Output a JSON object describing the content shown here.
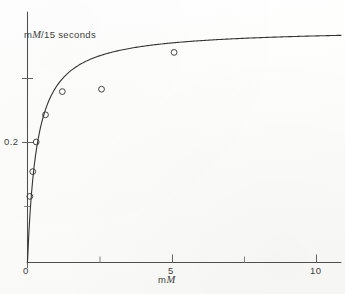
{
  "chart_data": {
    "type": "scatter",
    "title": "",
    "subtitle": "",
    "xlabel": "mM",
    "ylabel": "mM/15 seconds",
    "ylabel_prefix": "m",
    "ylabel_italic": "M",
    "ylabel_suffix": "/15 seconds",
    "xlabel_prefix": "m",
    "xlabel_italic": "M",
    "xlabel_suffix": "",
    "xlim": [
      0,
      10.8
    ],
    "ylim": [
      0,
      0.3125
    ],
    "grid": false,
    "legend": "none",
    "x_ticks_major": [
      0,
      5,
      10
    ],
    "x_tick_labels": [
      "0",
      "5",
      "10"
    ],
    "x_ticks_minor": [
      2.5,
      7.5
    ],
    "y_ticks_major": [
      0.2,
      0.3
    ],
    "y_tick_labels": [
      "0.2",
      ""
    ],
    "y_tick_label_0_2": "0.2",
    "x_label_0": "0",
    "x_label_5": "5",
    "x_label_10": "10",
    "marker": "open-circle",
    "points": [
      {
        "x": 0.08,
        "y": 0.082
      },
      {
        "x": 0.18,
        "y": 0.113
      },
      {
        "x": 0.3,
        "y": 0.15
      },
      {
        "x": 0.62,
        "y": 0.184
      },
      {
        "x": 1.2,
        "y": 0.213
      },
      {
        "x": 2.55,
        "y": 0.216
      },
      {
        "x": 5.05,
        "y": 0.262
      }
    ],
    "fit_curve": {
      "model": "michaelis-menten",
      "vmax": 0.292,
      "km": 0.33,
      "x_start": 0.0,
      "x_end": 10.8
    },
    "axis_color": "#4a4a4a",
    "curve_color": "#2e2e2e",
    "marker_color": "#3a3a3a",
    "paper_color": "#fdfdfc"
  },
  "figure": {
    "caption": ""
  }
}
